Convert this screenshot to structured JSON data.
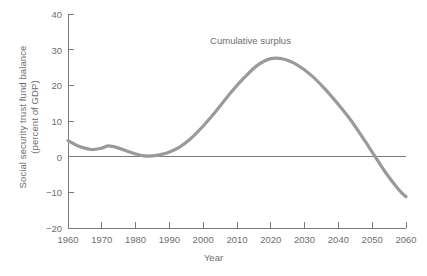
{
  "chart_data": {
    "type": "line",
    "title": "",
    "xlabel": "Year",
    "ylabel": "Social security trust fund balance (percent of GDP)",
    "ylabel_line1": "Social security trust fund balance",
    "ylabel_line2": "(percent of GDP)",
    "xlim": [
      1960,
      2060
    ],
    "ylim": [
      -20,
      40
    ],
    "xticks": [
      1960,
      1970,
      1980,
      1990,
      2000,
      2010,
      2020,
      2030,
      2040,
      2050,
      2060
    ],
    "xtick_labels": [
      "1960",
      "1970",
      "1980",
      "1990",
      "2000",
      "2010",
      "2020",
      "2030",
      "2040",
      "2050",
      "2060"
    ],
    "yticks": [
      -20,
      -10,
      0,
      10,
      20,
      30,
      40
    ],
    "ytick_labels": [
      "−20",
      "−10",
      "0",
      "10",
      "20",
      "30",
      "40"
    ],
    "grid": false,
    "legend": "none",
    "zero_line": true,
    "series": [
      {
        "name": "Cumulative surplus",
        "color": "#9a9a9a",
        "x": [
          1960,
          1963,
          1967,
          1970,
          1972,
          1975,
          1978,
          1982,
          1985,
          1988,
          1990,
          1993,
          1996,
          2000,
          2004,
          2008,
          2012,
          2016,
          2020,
          2024,
          2028,
          2032,
          2036,
          2040,
          2044,
          2048,
          2050,
          2054,
          2058,
          2060
        ],
        "values": [
          4.5,
          3.0,
          2.0,
          2.4,
          3.0,
          2.4,
          1.4,
          0.3,
          0.2,
          0.7,
          1.3,
          2.7,
          4.8,
          8.6,
          13.0,
          17.8,
          22.0,
          25.6,
          27.5,
          27.3,
          25.6,
          22.8,
          19.0,
          14.6,
          9.8,
          4.2,
          1.3,
          -4.5,
          -9.4,
          -11.2
        ]
      }
    ],
    "annotations": [
      {
        "text": "Cumulative surplus",
        "x": 2014,
        "y": 32.5
      }
    ]
  },
  "colors": {
    "axis": "#7a7a7a",
    "curve": "#9a9a9a",
    "text": "#6e6e6e",
    "zero_line": "#7a7a7a",
    "background": "#ffffff"
  }
}
